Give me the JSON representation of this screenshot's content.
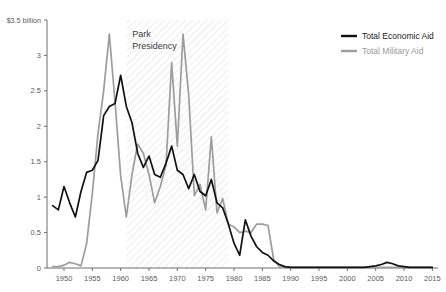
{
  "chart_data": {
    "type": "line",
    "title": "",
    "subtitle": "",
    "xlabel": "",
    "ylabel": "",
    "ylim": [
      0,
      3.5
    ],
    "xlim": [
      1947,
      2016
    ],
    "grid": false,
    "legend_position": "top-right",
    "y_unit": "billion US dollars",
    "y_top_label": "$3.5 billion",
    "y_ticks": [
      0,
      0.5,
      1,
      1.5,
      2,
      2.5,
      3,
      3.5
    ],
    "y_tick_labels": [
      "0",
      "0.5",
      "1",
      "1.5",
      "2",
      "2.5",
      "3",
      "$3.5 billion"
    ],
    "x_ticks": [
      1950,
      1955,
      1960,
      1965,
      1970,
      1975,
      1980,
      1985,
      1990,
      1995,
      2000,
      2005,
      2010,
      2015
    ],
    "x_tick_labels": [
      "1950",
      "1955",
      "1960",
      "1965",
      "1970",
      "1975",
      "1980",
      "1985",
      "1990",
      "1995",
      "2000",
      "2005",
      "2010",
      "2015"
    ],
    "annotations": [
      {
        "name": "park-presidency-band",
        "label_line1": "Park",
        "label_line2": "Presidency",
        "x_start": 1961,
        "x_end": 1979,
        "style": "diagonal-hatch"
      }
    ],
    "colors": {
      "economic": "#121212",
      "military": "#9d9d9d",
      "axis": "#6e6e6e",
      "hatch": "#d8d8d8",
      "background": "#ffffff"
    },
    "x": [
      1948,
      1949,
      1950,
      1951,
      1952,
      1953,
      1954,
      1955,
      1956,
      1957,
      1958,
      1959,
      1960,
      1961,
      1962,
      1963,
      1964,
      1965,
      1966,
      1967,
      1968,
      1969,
      1970,
      1971,
      1972,
      1973,
      1974,
      1975,
      1976,
      1977,
      1978,
      1979,
      1980,
      1981,
      1982,
      1983,
      1984,
      1985,
      1986,
      1987,
      1988,
      1989,
      1990,
      1991,
      1992,
      1993,
      1994,
      1995,
      1996,
      1997,
      1998,
      1999,
      2000,
      2001,
      2002,
      2003,
      2004,
      2005,
      2006,
      2007,
      2008,
      2009,
      2010,
      2011,
      2012,
      2013,
      2014,
      2015
    ],
    "series": [
      {
        "name": "Total Economic Aid",
        "color": "#121212",
        "values": [
          0.88,
          0.82,
          1.15,
          0.92,
          0.72,
          1.08,
          1.35,
          1.38,
          1.52,
          2.15,
          2.28,
          2.32,
          2.72,
          2.28,
          2.05,
          1.62,
          1.42,
          1.58,
          1.32,
          1.28,
          1.48,
          1.72,
          1.38,
          1.32,
          1.12,
          1.32,
          1.08,
          1.02,
          1.25,
          0.92,
          0.85,
          0.62,
          0.35,
          0.18,
          0.68,
          0.45,
          0.3,
          0.22,
          0.18,
          0.1,
          0.05,
          0.02,
          0.01,
          0.01,
          0.01,
          0.01,
          0.01,
          0.01,
          0.01,
          0.01,
          0.01,
          0.01,
          0.01,
          0.01,
          0.01,
          0.01,
          0.02,
          0.03,
          0.05,
          0.08,
          0.06,
          0.03,
          0.02,
          0.01,
          0.01,
          0.01,
          0.01,
          0.01
        ]
      },
      {
        "name": "Total Military Aid",
        "color": "#9d9d9d",
        "values": [
          0.02,
          0.02,
          0.04,
          0.08,
          0.06,
          0.03,
          0.35,
          1.05,
          1.9,
          2.5,
          3.3,
          2.35,
          1.3,
          0.72,
          1.32,
          1.75,
          1.62,
          1.32,
          0.92,
          1.15,
          1.45,
          2.9,
          1.72,
          3.3,
          2.45,
          1.02,
          1.18,
          0.82,
          1.85,
          0.78,
          0.98,
          0.62,
          0.58,
          0.5,
          0.52,
          0.5,
          0.62,
          0.62,
          0.6,
          0.12,
          0.02,
          0.01,
          0.01,
          0.01,
          0.01,
          0.01,
          0.01,
          0.01,
          0.01,
          0.01,
          0.01,
          0.01,
          0.01,
          0.01,
          0.01,
          0.01,
          0.01,
          0.01,
          0.01,
          0.01,
          0.01,
          0.01,
          0.01,
          0.01,
          0.01,
          0.01,
          0.01,
          0.01
        ]
      }
    ]
  },
  "legend": {
    "items": [
      {
        "label": "Total Economic Aid",
        "color": "#121212",
        "swatch": "line-swatch"
      },
      {
        "label": "Total Military Aid",
        "color": "#9d9d9d",
        "swatch": "line-swatch"
      }
    ]
  },
  "axis": {
    "y_top_label": "$3.5 billion"
  }
}
